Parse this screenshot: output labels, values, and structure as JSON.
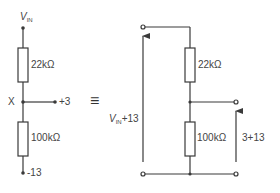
{
  "left_circuit": {
    "input_label": {
      "symbol": "V",
      "subscript": "IN"
    },
    "resistor_top": "22kΩ",
    "resistor_bottom": "100kΩ",
    "node_label": "X",
    "node_output": "+3",
    "bottom_terminal": "-13"
  },
  "equivalence_symbol": "≡",
  "right_circuit": {
    "resistor_top": "22kΩ",
    "resistor_bottom": "100kΩ",
    "input_voltage_label": {
      "symbol": "V",
      "subscript": "IN",
      "suffix": "+13"
    },
    "output_voltage_label": "3+13"
  },
  "colors": {
    "line": "#3a3a3a",
    "background": "#ffffff"
  }
}
